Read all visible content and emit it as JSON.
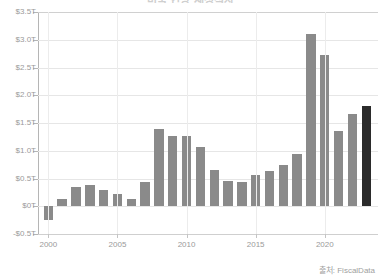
{
  "chart_data": {
    "type": "bar",
    "title": "미국 연방 재정적자",
    "source_note": "출처: FiscalData",
    "xlabel": "",
    "ylabel": "",
    "categories": [
      "2000",
      "2001",
      "2002",
      "2003",
      "2004",
      "2005",
      "2006",
      "2007",
      "2008",
      "2009",
      "2010",
      "2011",
      "2012",
      "2013",
      "2014",
      "2015",
      "2016",
      "2017",
      "2018",
      "2019",
      "2020",
      "2021",
      "2022",
      "2023",
      "2024"
    ],
    "values": [
      -0.24,
      0.13,
      0.35,
      0.39,
      0.3,
      0.22,
      0.13,
      0.44,
      1.4,
      1.26,
      1.27,
      1.06,
      0.66,
      0.45,
      0.43,
      0.57,
      0.63,
      0.75,
      0.95,
      3.1,
      2.73,
      1.35,
      1.66,
      1.8,
      1.8
    ],
    "series": [
      {
        "name": "Deficit",
        "points": [
          {
            "year": "2000",
            "value": -0.24,
            "highlight": false
          },
          {
            "year": "2001",
            "value": 0.13,
            "highlight": false
          },
          {
            "year": "2002",
            "value": 0.35,
            "highlight": false
          },
          {
            "year": "2003",
            "value": 0.39,
            "highlight": false
          },
          {
            "year": "2004",
            "value": 0.3,
            "highlight": false
          },
          {
            "year": "2005",
            "value": 0.22,
            "highlight": false
          },
          {
            "year": "2006",
            "value": 0.13,
            "highlight": false
          },
          {
            "year": "2007",
            "value": 0.44,
            "highlight": false
          },
          {
            "year": "2008",
            "value": 1.4,
            "highlight": false
          },
          {
            "year": "2009",
            "value": 1.26,
            "highlight": false
          },
          {
            "year": "2010",
            "value": 1.27,
            "highlight": false
          },
          {
            "year": "2011",
            "value": 1.06,
            "highlight": false
          },
          {
            "year": "2012",
            "value": 0.66,
            "highlight": false
          },
          {
            "year": "2013",
            "value": 0.45,
            "highlight": false
          },
          {
            "year": "2014",
            "value": 0.43,
            "highlight": false
          },
          {
            "year": "2015",
            "value": 0.57,
            "highlight": false
          },
          {
            "year": "2016",
            "value": 0.63,
            "highlight": false
          },
          {
            "year": "2017",
            "value": 0.75,
            "highlight": false
          },
          {
            "year": "2018",
            "value": 0.95,
            "highlight": false
          },
          {
            "year": "2019",
            "value": 3.1,
            "highlight": false
          },
          {
            "year": "2020",
            "value": 2.73,
            "highlight": false
          },
          {
            "year": "2021",
            "value": 1.35,
            "highlight": false
          },
          {
            "year": "2022",
            "value": 1.66,
            "highlight": false
          },
          {
            "year": "2023",
            "value": 1.8,
            "highlight": true
          }
        ]
      }
    ],
    "y_ticks": [
      {
        "label": "$3.5T",
        "value": 3.5
      },
      {
        "label": "$3.0T",
        "value": 3.0
      },
      {
        "label": "$2.5T",
        "value": 2.5
      },
      {
        "label": "$2.0T",
        "value": 2.0
      },
      {
        "label": "$1.5T",
        "value": 1.5
      },
      {
        "label": "$1.0T",
        "value": 1.0
      },
      {
        "label": "$0.5T",
        "value": 0.5
      },
      {
        "label": "$0T",
        "value": 0.0
      },
      {
        "label": "-$0.5T",
        "value": -0.5
      }
    ],
    "x_ticks": [
      {
        "label": "2000",
        "index": 0
      },
      {
        "label": "2005",
        "index": 5
      },
      {
        "label": "2010",
        "index": 10
      },
      {
        "label": "2015",
        "index": 15
      },
      {
        "label": "2020",
        "index": 20
      }
    ],
    "ylim": [
      -0.5,
      3.5
    ],
    "grid": true,
    "legend": "none",
    "colors": {
      "bar": "#8a8a8a",
      "bar_highlight": "#2b2b2b",
      "grid": "#e6e6e6",
      "axis": "#b5b5b5",
      "tick_text": "#9a9a9a",
      "source_text": "#a0a0a0",
      "background": "#ffffff"
    }
  }
}
